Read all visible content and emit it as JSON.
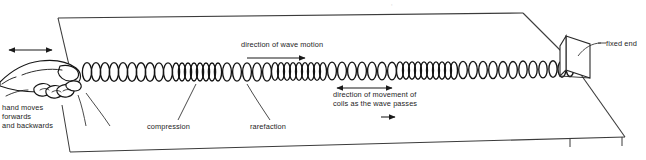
{
  "figure": {
    "background_color": "#ffffff",
    "ink_color": "#1a1a1a",
    "clipped_text_top": "    ,"
  },
  "labels": {
    "hand": "hand moves\nforwards\nand backwards",
    "compression": "compression",
    "rarefaction": "rarefaction",
    "wave_motion": "direction of wave motion",
    "coils_movement": "direction of movement of\ncoils as the wave passes",
    "fixed_end": "fixed end"
  },
  "arrows": {
    "hand_oscillation": {
      "type": "double-headed",
      "orientation": "horizontal"
    },
    "wave_motion": {
      "type": "single-headed",
      "orientation": "horizontal",
      "points": "right"
    },
    "coil_movement": {
      "type": "double-headed",
      "orientation": "horizontal"
    },
    "coil_movement_small": {
      "type": "single-headed",
      "orientation": "horizontal",
      "points": "right"
    }
  },
  "elements": {
    "table": "table-surface",
    "spring": "coil-spring",
    "hand": "hand-gripping-spring",
    "post": "fixed-end-post"
  }
}
